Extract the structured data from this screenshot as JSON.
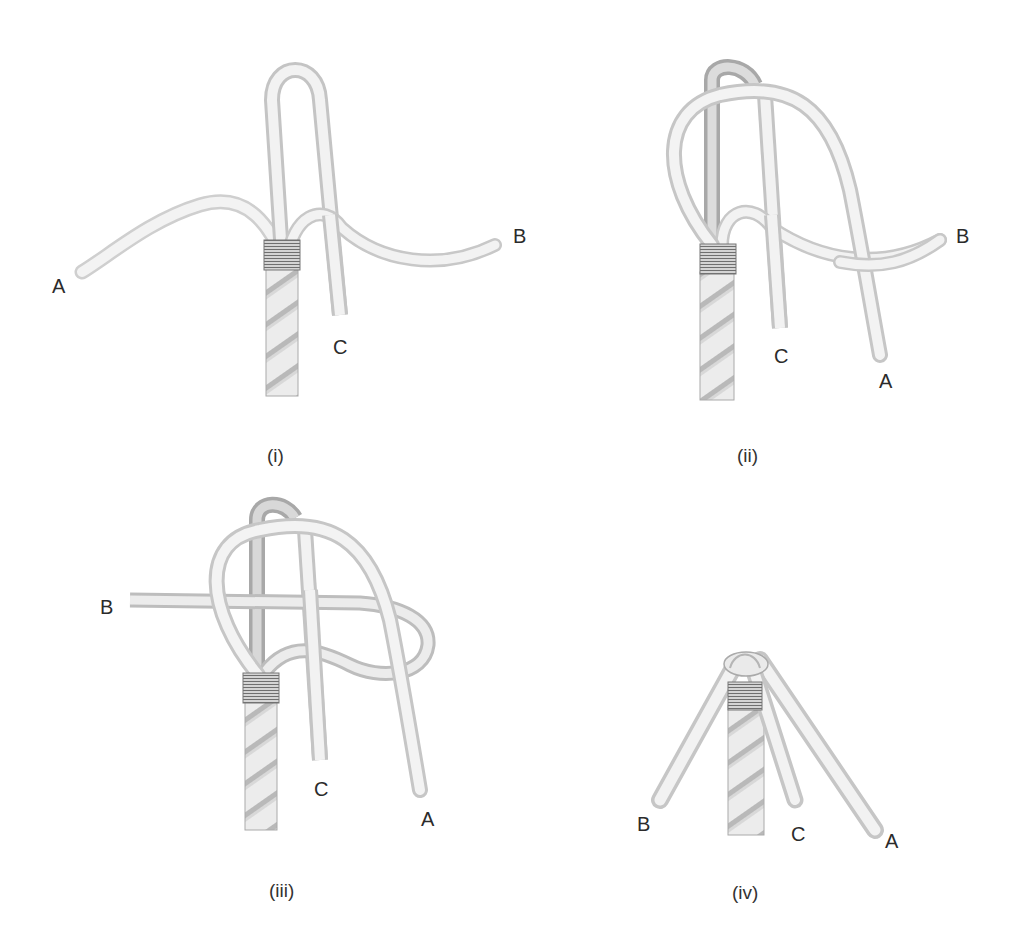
{
  "figure": {
    "panels": [
      {
        "id": "i",
        "caption": "(i)",
        "labels": {
          "A": "A",
          "B": "B",
          "C": "C"
        }
      },
      {
        "id": "ii",
        "caption": "(ii)",
        "labels": {
          "A": "A",
          "B": "B",
          "C": "C"
        }
      },
      {
        "id": "iii",
        "caption": "(iii)",
        "labels": {
          "A": "A",
          "B": "B",
          "C": "C"
        }
      },
      {
        "id": "iv",
        "caption": "(iv)",
        "labels": {
          "A": "A",
          "B": "B",
          "C": "C"
        }
      }
    ],
    "colors": {
      "background": "#ffffff",
      "rope_fill": "#f2f2f2",
      "rope_shadow": "#b8b8b8",
      "rope_outline": "#9a9a9a",
      "whipping": "#7a7a7a",
      "label_text": "#2b2b2b"
    }
  }
}
